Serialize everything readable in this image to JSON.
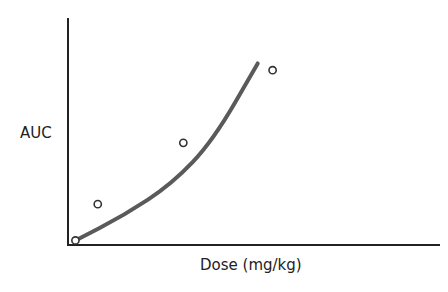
{
  "chart_data": {
    "type": "scatter",
    "title": "",
    "xlabel": "Dose (mg/kg)",
    "ylabel": "AUC",
    "grid": false,
    "legend": null,
    "axes": {
      "x_ticks": [],
      "y_ticks": [],
      "xlim": [
        0,
        1
      ],
      "ylim": [
        0,
        1
      ]
    },
    "series": [
      {
        "name": "observed",
        "kind": "scatter",
        "marker": "open-circle",
        "points": [
          {
            "x": 0.02,
            "y": 0.02
          },
          {
            "x": 0.08,
            "y": 0.18
          },
          {
            "x": 0.31,
            "y": 0.45
          },
          {
            "x": 0.55,
            "y": 0.77
          }
        ]
      },
      {
        "name": "fitted curve",
        "kind": "line",
        "color": "#5a5a5a",
        "points": [
          {
            "x": 0.02,
            "y": 0.02
          },
          {
            "x": 0.15,
            "y": 0.13
          },
          {
            "x": 0.28,
            "y": 0.27
          },
          {
            "x": 0.39,
            "y": 0.46
          },
          {
            "x": 0.51,
            "y": 0.8
          }
        ]
      }
    ],
    "annotations": []
  },
  "colors": {
    "axis": "#222222",
    "curve": "#5a5a5a",
    "marker": "#333333"
  }
}
